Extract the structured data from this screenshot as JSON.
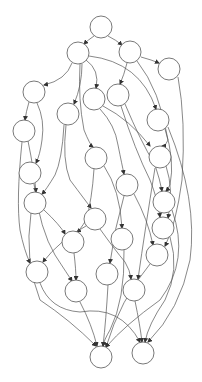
{
  "diagram": {
    "type": "directed-graph",
    "background": "#ffffff",
    "stroke_color": "#555555",
    "node_radius": 11,
    "nodes": [
      {
        "id": "n0",
        "x": 101,
        "y": 27
      },
      {
        "id": "n1",
        "x": 78,
        "y": 53
      },
      {
        "id": "n2",
        "x": 130,
        "y": 52
      },
      {
        "id": "n3",
        "x": 169,
        "y": 69
      },
      {
        "id": "n4",
        "x": 34,
        "y": 92
      },
      {
        "id": "n5",
        "x": 94,
        "y": 99
      },
      {
        "id": "n6",
        "x": 118,
        "y": 95
      },
      {
        "id": "n7",
        "x": 68,
        "y": 114
      },
      {
        "id": "n8",
        "x": 158,
        "y": 120
      },
      {
        "id": "n9",
        "x": 24,
        "y": 131
      },
      {
        "id": "n10",
        "x": 96,
        "y": 158
      },
      {
        "id": "n11",
        "x": 160,
        "y": 157
      },
      {
        "id": "n12",
        "x": 30,
        "y": 173
      },
      {
        "id": "n13",
        "x": 127,
        "y": 185
      },
      {
        "id": "n14",
        "x": 35,
        "y": 203
      },
      {
        "id": "n15",
        "x": 164,
        "y": 202
      },
      {
        "id": "n16",
        "x": 95,
        "y": 219
      },
      {
        "id": "n17",
        "x": 163,
        "y": 228
      },
      {
        "id": "n18",
        "x": 122,
        "y": 239
      },
      {
        "id": "n19",
        "x": 73,
        "y": 242
      },
      {
        "id": "n20",
        "x": 157,
        "y": 255
      },
      {
        "id": "n21",
        "x": 37,
        "y": 272
      },
      {
        "id": "n22",
        "x": 107,
        "y": 274
      },
      {
        "id": "n23",
        "x": 76,
        "y": 291
      },
      {
        "id": "n24",
        "x": 134,
        "y": 290
      },
      {
        "id": "n25",
        "x": 101,
        "y": 357
      },
      {
        "id": "n26",
        "x": 143,
        "y": 353
      }
    ],
    "edges": [
      {
        "from": "n0",
        "to": "n1",
        "d": "M94,36 Q88,40 84,44"
      },
      {
        "from": "n0",
        "to": "n2",
        "d": "M108,36 Q116,40 122,45"
      },
      {
        "from": "n1",
        "to": "n4",
        "d": "M72,63 Q66,80 44,85"
      },
      {
        "from": "n1",
        "to": "n7",
        "d": "M82,64 Q82,85 74,104"
      },
      {
        "from": "n1",
        "to": "n5",
        "d": "M86,60 Q100,70 96,88"
      },
      {
        "from": "n1",
        "to": "n8",
        "d": "M89,56 Q140,62 156,109"
      },
      {
        "from": "n1",
        "to": "n10",
        "d": "M80,64 Q78,100 84,130 Q90,145 93,147"
      },
      {
        "from": "n2",
        "to": "n6",
        "d": "M127,63 Q124,75 120,84"
      },
      {
        "from": "n2",
        "to": "n3",
        "d": "M141,57 Q152,60 159,63"
      },
      {
        "from": "n2",
        "to": "n11",
        "d": "M137,61 Q160,90 168,140 Q166,146 162,146"
      },
      {
        "from": "n3",
        "to": "n20",
        "d": "M178,77 Q186,120 182,180 Q176,225 165,246"
      },
      {
        "from": "n4",
        "to": "n9",
        "d": "M29,102 Q26,112 25,120"
      },
      {
        "from": "n4",
        "to": "n12",
        "d": "M37,103 Q45,120 42,140 Q40,155 36,163"
      },
      {
        "from": "n5",
        "to": "n13",
        "d": "M100,109 Q115,125 118,145 Q122,165 124,174"
      },
      {
        "from": "n5",
        "to": "n11",
        "d": "M103,106 Q130,120 150,146"
      },
      {
        "from": "n6",
        "to": "n15",
        "d": "M125,104 Q140,140 155,165 Q160,180 162,191"
      },
      {
        "from": "n6",
        "to": "n17",
        "d": "M121,106 Q135,150 150,180 Q158,200 160,217"
      },
      {
        "from": "n7",
        "to": "n14",
        "d": "M64,125 Q62,160 55,175 Q46,190 42,194"
      },
      {
        "from": "n7",
        "to": "n16",
        "d": "M66,125 Q62,160 70,180 Q85,200 91,208"
      },
      {
        "from": "n8",
        "to": "n15",
        "d": "M165,129 Q175,160 170,185 Q167,190 166,191"
      },
      {
        "from": "n8",
        "to": "n26",
        "d": "M168,127 Q198,200 190,260 Q180,310 148,342"
      },
      {
        "from": "n9",
        "to": "n21",
        "d": "M22,142 Q16,200 20,230 Q24,250 30,263"
      },
      {
        "from": "n9",
        "to": "n14",
        "d": "M28,141 Q34,170 36,192"
      },
      {
        "from": "n10",
        "to": "n19",
        "d": "M94,169 Q92,200 86,220 Q80,230 77,232"
      },
      {
        "from": "n10",
        "to": "n18",
        "d": "M104,166 Q120,190 122,228"
      },
      {
        "from": "n11",
        "to": "n24",
        "d": "M155,168 Q145,230 138,279"
      },
      {
        "from": "n11",
        "to": "n17",
        "d": "M166,166 Q174,190 168,218"
      },
      {
        "from": "n12",
        "to": "n23",
        "d": "M34,184 Q40,230 55,255 Q68,275 72,281"
      },
      {
        "from": "n13",
        "to": "n22",
        "d": "M124,196 Q114,230 110,263"
      },
      {
        "from": "n13",
        "to": "n20",
        "d": "M134,194 Q148,220 153,245"
      },
      {
        "from": "n14",
        "to": "n19",
        "d": "M44,210 Q60,225 65,234"
      },
      {
        "from": "n14",
        "to": "n25",
        "d": "M31,213 Q24,260 40,300 Q70,320 96,346"
      },
      {
        "from": "n15",
        "to": "n25",
        "d": "M172,210 Q190,260 160,300 Q125,325 106,347"
      },
      {
        "from": "n16",
        "to": "n24",
        "d": "M100,229 Q115,250 125,262 Q130,270 131,279"
      },
      {
        "from": "n16",
        "to": "n21",
        "d": "M86,226 Q60,240 43,262"
      },
      {
        "from": "n17",
        "to": "n26",
        "d": "M170,237 Q180,270 165,300 Q148,325 145,342"
      },
      {
        "from": "n18",
        "to": "n25",
        "d": "M124,250 Q125,300 110,330 Q104,340 103,346"
      },
      {
        "from": "n19",
        "to": "n23",
        "d": "M74,253 Q76,270 76,280"
      },
      {
        "from": "n20",
        "to": "n25",
        "d": "M150,264 Q120,300 106,347"
      },
      {
        "from": "n21",
        "to": "n26",
        "d": "M40,283 Q50,310 80,312 Q120,305 140,342"
      },
      {
        "from": "n22",
        "to": "n25",
        "d": "M108,285 Q106,320 103,346"
      },
      {
        "from": "n23",
        "to": "n25",
        "d": "M80,302 Q92,325 97,346"
      },
      {
        "from": "n24",
        "to": "n26",
        "d": "M135,301 Q140,325 142,342"
      }
    ]
  }
}
